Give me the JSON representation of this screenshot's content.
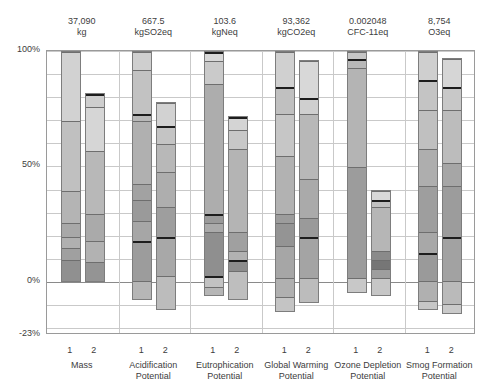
{
  "chart_data": {
    "type": "bar",
    "subtype": "stacked-bar-normalized-with-negatives",
    "title": "",
    "xlabel": "",
    "ylabel": "",
    "ylim": [
      -23,
      100
    ],
    "yticks": [
      100,
      50,
      0,
      -23
    ],
    "ytick_labels": [
      "100%",
      "50%",
      "0%",
      "-23%"
    ],
    "grid": true,
    "legend": "none",
    "categories": [
      "Mass",
      "Acidification Potential",
      "Eutrophication Potential",
      "Global Warming Potential",
      "Ozone Depletion Potential",
      "Smog Formation Potential"
    ],
    "series_labels": [
      "1",
      "2"
    ],
    "totals": [
      {
        "value": "37,090",
        "unit": "kg"
      },
      {
        "value": "667.5",
        "unit": "kgSO2eq"
      },
      {
        "value": "103.6",
        "unit": "kgNeq"
      },
      {
        "value": "93,362",
        "unit": "kgCO2eq"
      },
      {
        "value": "0.002048",
        "unit": "CFC-11eq"
      },
      {
        "value": "8,754",
        "unit": "O3eq"
      }
    ],
    "groups": [
      {
        "name": "Mass",
        "total": "37,090",
        "unit": "kg",
        "bars": [
          {
            "label": "1",
            "top": 100,
            "bottom": 0,
            "segments": [
              {
                "from": 100,
                "to": 70,
                "color": "#d2d2d2"
              },
              {
                "from": 70,
                "to": 40,
                "color": "#c0c0c0"
              },
              {
                "from": 40,
                "to": 26,
                "color": "#b4b4b4"
              },
              {
                "from": 26,
                "to": 20,
                "color": "#a8a8a8"
              },
              {
                "from": 20,
                "to": 15,
                "color": "#b0b0b0"
              },
              {
                "from": 15,
                "to": 10,
                "color": "#a0a0a0"
              },
              {
                "from": 10,
                "to": 0,
                "color": "#909090"
              }
            ]
          },
          {
            "label": "2",
            "top": 82,
            "bottom": 0,
            "segments": [
              {
                "from": 82,
                "to": 76,
                "color": "#cecece",
                "rule": "thick"
              },
              {
                "from": 76,
                "to": 57,
                "color": "#d6d6d6"
              },
              {
                "from": 57,
                "to": 30,
                "color": "#b8b8b8"
              },
              {
                "from": 30,
                "to": 18,
                "color": "#aaaaaa"
              },
              {
                "from": 18,
                "to": 9,
                "color": "#b2b2b2"
              },
              {
                "from": 9,
                "to": 0,
                "color": "#949494"
              }
            ]
          }
        ]
      },
      {
        "name": "Acidification Potential",
        "total": "667.5",
        "unit": "kgSO2eq",
        "bars": [
          {
            "label": "1",
            "top": 100,
            "bottom": -8,
            "segments": [
              {
                "from": 100,
                "to": 92,
                "color": "#cfcfcf"
              },
              {
                "from": 92,
                "to": 73,
                "color": "#c2c2c2"
              },
              {
                "from": 73,
                "to": 70,
                "color": "#b8b8b8",
                "rule": "thick"
              },
              {
                "from": 70,
                "to": 43,
                "color": "#b0b0b0"
              },
              {
                "from": 43,
                "to": 36,
                "color": "#a2a2a2"
              },
              {
                "from": 36,
                "to": 27,
                "color": "#9a9a9a"
              },
              {
                "from": 27,
                "to": 18,
                "color": "#a6a6a6"
              },
              {
                "from": 18,
                "to": 1,
                "color": "#9c9c9c",
                "rule": "thick"
              },
              {
                "from": 1,
                "to": -8,
                "color": "#b6b6b6"
              }
            ]
          },
          {
            "label": "2",
            "top": 78,
            "bottom": -12,
            "segments": [
              {
                "from": 78,
                "to": 68,
                "color": "#d2d2d2"
              },
              {
                "from": 68,
                "to": 60,
                "color": "#c4c4c4",
                "rule": "thick"
              },
              {
                "from": 60,
                "to": 48,
                "color": "#b8b8b8"
              },
              {
                "from": 48,
                "to": 33,
                "color": "#aeaeae"
              },
              {
                "from": 33,
                "to": 20,
                "color": "#9e9e9e"
              },
              {
                "from": 20,
                "to": 3,
                "color": "#a8a8a8",
                "rule": "thick"
              },
              {
                "from": 3,
                "to": -12,
                "color": "#bcbcbc"
              }
            ]
          }
        ]
      },
      {
        "name": "Eutrophication Potential",
        "total": "103.6",
        "unit": "kgNeq",
        "bars": [
          {
            "label": "1",
            "top": 100,
            "bottom": -6,
            "segments": [
              {
                "from": 100,
                "to": 96,
                "color": "#d8d8d8",
                "rule": "thick"
              },
              {
                "from": 96,
                "to": 86,
                "color": "#cacaca"
              },
              {
                "from": 86,
                "to": 30,
                "color": "#adadad"
              },
              {
                "from": 30,
                "to": 26,
                "color": "#9a9a9a",
                "rule": "thick"
              },
              {
                "from": 26,
                "to": 22,
                "color": "#aaaaaa"
              },
              {
                "from": 22,
                "to": 3,
                "color": "#8f8f8f"
              },
              {
                "from": 3,
                "to": -2,
                "color": "#c2c2c2",
                "rule": "thick"
              },
              {
                "from": -2,
                "to": -6,
                "color": "#b6b6b6"
              }
            ]
          },
          {
            "label": "2",
            "top": 72,
            "bottom": -8,
            "segments": [
              {
                "from": 72,
                "to": 66,
                "color": "#d4d4d4",
                "rule": "thick"
              },
              {
                "from": 66,
                "to": 58,
                "color": "#c8c8c8"
              },
              {
                "from": 58,
                "to": 22,
                "color": "#b4b4b4"
              },
              {
                "from": 22,
                "to": 14,
                "color": "#a0a0a0"
              },
              {
                "from": 14,
                "to": 10,
                "color": "#b2b2b2"
              },
              {
                "from": 10,
                "to": 5,
                "color": "#8c8c8c",
                "rule": "thick"
              },
              {
                "from": 5,
                "to": -8,
                "color": "#bebebe"
              }
            ]
          }
        ]
      },
      {
        "name": "Global Warming Potential",
        "total": "93,362",
        "unit": "kgCO2eq",
        "bars": [
          {
            "label": "1",
            "top": 100,
            "bottom": -13,
            "segments": [
              {
                "from": 100,
                "to": 85,
                "color": "#d0d0d0"
              },
              {
                "from": 85,
                "to": 73,
                "color": "#c0c0c0",
                "rule": "thick"
              },
              {
                "from": 73,
                "to": 55,
                "color": "#c6c6c6"
              },
              {
                "from": 55,
                "to": 30,
                "color": "#b2b2b2"
              },
              {
                "from": 30,
                "to": 26,
                "color": "#9c9c9c"
              },
              {
                "from": 26,
                "to": 16,
                "color": "#949494"
              },
              {
                "from": 16,
                "to": 2,
                "color": "#a6a6a6"
              },
              {
                "from": 2,
                "to": -6,
                "color": "#b0b0b0"
              },
              {
                "from": -6,
                "to": -13,
                "color": "#c4c4c4"
              }
            ]
          },
          {
            "label": "2",
            "top": 96,
            "bottom": -9,
            "segments": [
              {
                "from": 96,
                "to": 80,
                "color": "#d8d8d8"
              },
              {
                "from": 80,
                "to": 73,
                "color": "#cfcfcf",
                "rule": "thick"
              },
              {
                "from": 73,
                "to": 45,
                "color": "#b8b8b8"
              },
              {
                "from": 45,
                "to": 28,
                "color": "#aaaaaa"
              },
              {
                "from": 28,
                "to": 20,
                "color": "#9a9a9a"
              },
              {
                "from": 20,
                "to": 2,
                "color": "#a4a4a4",
                "rule": "thick"
              },
              {
                "from": 2,
                "to": -9,
                "color": "#bcbcbc"
              }
            ]
          }
        ]
      },
      {
        "name": "Ozone Depletion Potential",
        "total": "0.002048",
        "unit": "CFC-11eq",
        "bars": [
          {
            "label": "1",
            "top": 100,
            "bottom": -5,
            "segments": [
              {
                "from": 100,
                "to": 97,
                "color": "#c6c6c6"
              },
              {
                "from": 97,
                "to": 93,
                "color": "#b8b8b8",
                "rule": "thick"
              },
              {
                "from": 93,
                "to": 50,
                "color": "#b4b4b4"
              },
              {
                "from": 50,
                "to": 2,
                "color": "#9c9c9c"
              },
              {
                "from": 2,
                "to": -5,
                "color": "#c8c8c8"
              }
            ]
          },
          {
            "label": "2",
            "top": 40,
            "bottom": -6,
            "segments": [
              {
                "from": 40,
                "to": 36,
                "color": "#d8d8d8"
              },
              {
                "from": 36,
                "to": 33,
                "color": "#c0c0c0",
                "rule": "thick"
              },
              {
                "from": 33,
                "to": 14,
                "color": "#b6b6b6"
              },
              {
                "from": 14,
                "to": 10,
                "color": "#8a8a8a"
              },
              {
                "from": 10,
                "to": 6,
                "color": "#767676"
              },
              {
                "from": 6,
                "to": 2,
                "color": "#9e9e9e"
              },
              {
                "from": 2,
                "to": -6,
                "color": "#c6c6c6"
              }
            ]
          }
        ]
      },
      {
        "name": "Smog Formation Potential",
        "total": "8,754",
        "unit": "O3eq",
        "bars": [
          {
            "label": "1",
            "top": 100,
            "bottom": -12,
            "segments": [
              {
                "from": 100,
                "to": 88,
                "color": "#cfcfcf"
              },
              {
                "from": 88,
                "to": 75,
                "color": "#c4c4c4",
                "rule": "thick"
              },
              {
                "from": 75,
                "to": 58,
                "color": "#c0c0c0"
              },
              {
                "from": 58,
                "to": 42,
                "color": "#aeaeae"
              },
              {
                "from": 42,
                "to": 22,
                "color": "#9e9e9e"
              },
              {
                "from": 22,
                "to": 13,
                "color": "#a8a8a8"
              },
              {
                "from": 13,
                "to": 1,
                "color": "#9a9a9a",
                "rule": "thick"
              },
              {
                "from": 1,
                "to": -8,
                "color": "#b0b0b0"
              },
              {
                "from": -8,
                "to": -12,
                "color": "#c6c6c6"
              }
            ]
          },
          {
            "label": "2",
            "top": 97,
            "bottom": -14,
            "segments": [
              {
                "from": 97,
                "to": 85,
                "color": "#d6d6d6"
              },
              {
                "from": 85,
                "to": 75,
                "color": "#c8c8c8",
                "rule": "thick"
              },
              {
                "from": 75,
                "to": 52,
                "color": "#bcbcbc"
              },
              {
                "from": 52,
                "to": 42,
                "color": "#a6a6a6"
              },
              {
                "from": 42,
                "to": 20,
                "color": "#9c9c9c"
              },
              {
                "from": 20,
                "to": 1,
                "color": "#a2a2a2",
                "rule": "thick"
              },
              {
                "from": 1,
                "to": -9,
                "color": "#bababa"
              },
              {
                "from": -9,
                "to": -14,
                "color": "#cacaca"
              }
            ]
          }
        ]
      }
    ]
  }
}
